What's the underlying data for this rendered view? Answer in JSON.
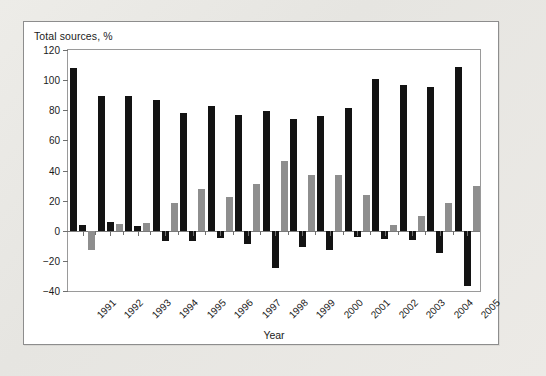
{
  "figure": {
    "y_axis_caption": "Total sources, %",
    "x_axis_title": "Year"
  },
  "legend": {
    "items": [
      {
        "label": "Internal funds",
        "color": "#131313"
      },
      {
        "label": "Net equity issues",
        "color": "#131313"
      },
      {
        "label": "Net borrowing",
        "color": "#8e8e8e"
      }
    ]
  },
  "chart_data": {
    "type": "bar",
    "title": "",
    "subtitle": "",
    "xlabel": "Year",
    "ylabel": "Total sources, %",
    "ylim": [
      -40,
      120
    ],
    "yticks": [
      120,
      100,
      80,
      60,
      40,
      20,
      0,
      -20,
      -40
    ],
    "ytick_labels": [
      "120",
      "100",
      "80",
      "60",
      "40",
      "20",
      "0",
      "−20",
      "−40"
    ],
    "grid": false,
    "legend_position": "top-center-inside",
    "categories": [
      "1991",
      "1992",
      "1993",
      "1994",
      "1995",
      "1996",
      "1997",
      "1998",
      "1999",
      "2000",
      "2001",
      "2002",
      "2003",
      "2004",
      "2005"
    ],
    "series": [
      {
        "name": "Internal funds",
        "color": "#131313",
        "values": [
          108,
          89.5,
          89.5,
          87,
          78.5,
          83,
          77,
          79.5,
          74,
          76.5,
          81.5,
          101,
          96.5,
          95.5,
          108.5
        ]
      },
      {
        "name": "Net equity issues",
        "color": "#131313",
        "values": [
          4,
          5.5,
          3,
          -6.5,
          -7,
          -5,
          -9,
          -25,
          -11,
          -12.5,
          -4,
          -5.5,
          -6,
          -14.5,
          -37
        ]
      },
      {
        "name": "Net borrowing",
        "color": "#8e8e8e",
        "values": [
          -13,
          4.5,
          5,
          18.5,
          28,
          22.5,
          31,
          46.5,
          37,
          37,
          23.5,
          4,
          9.5,
          18.5,
          30
        ]
      }
    ]
  }
}
